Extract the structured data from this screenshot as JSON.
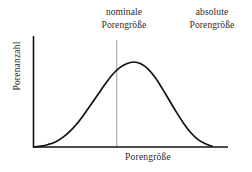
{
  "chart_data": {
    "type": "line",
    "title": "",
    "xlabel": "Porengröße",
    "ylabel": "Porenanzahl",
    "grid": false,
    "legend_position": "none",
    "axis_ticks": [],
    "xlim": [
      0,
      100
    ],
    "ylim": [
      0,
      100
    ],
    "annotations": [
      {
        "name": "nominal-pore-size",
        "line1": "nominale",
        "line2": "Porengröße",
        "marker": "vertical-line",
        "x_fraction": 0.465
      },
      {
        "name": "absolute-pore-size",
        "line1": "absolute",
        "line2": "Porengröße",
        "marker": "none",
        "x_fraction": 0.88
      }
    ],
    "series": [
      {
        "name": "pore-size-distribution",
        "color": "#111111",
        "x": [
          0,
          4,
          8,
          12,
          16,
          20,
          24,
          28,
          32,
          36,
          40,
          44,
          48,
          52,
          56,
          60,
          64,
          68,
          72,
          76,
          80,
          84,
          88,
          92,
          96,
          100
        ],
        "y": [
          0,
          1,
          3,
          6,
          11,
          18,
          27,
          38,
          50,
          62,
          74,
          85,
          93,
          98,
          100,
          98,
          92,
          82,
          69,
          55,
          41,
          28,
          17,
          9,
          4,
          1
        ]
      }
    ],
    "colors": {
      "curve": "#111111",
      "axis": "#111111",
      "guide_line": "#9a9a9a",
      "background": "#ffffff",
      "text": "#2a2a2a"
    }
  }
}
